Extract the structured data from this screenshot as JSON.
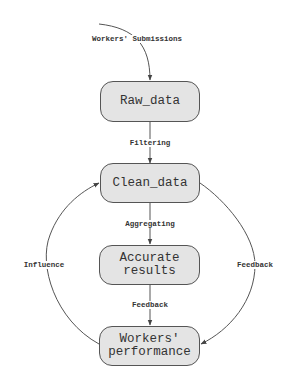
{
  "diagram": {
    "nodes": [
      {
        "id": "raw_data",
        "label": "Raw_data"
      },
      {
        "id": "clean_data",
        "label": "Clean_data"
      },
      {
        "id": "accurate_results",
        "label": "Accurate\nresults"
      },
      {
        "id": "workers_performance",
        "label": "Workers'\nperformance"
      }
    ],
    "edges": [
      {
        "from": "external",
        "to": "raw_data",
        "label": "Workers' Submissions"
      },
      {
        "from": "raw_data",
        "to": "clean_data",
        "label": "Filtering"
      },
      {
        "from": "clean_data",
        "to": "accurate_results",
        "label": "Aggregating"
      },
      {
        "from": "accurate_results",
        "to": "workers_performance",
        "label": "Feedback"
      },
      {
        "from": "workers_performance",
        "to": "clean_data",
        "label": "Influence"
      },
      {
        "from": "clean_data",
        "to": "workers_performance",
        "label": "Feedback"
      }
    ],
    "colors": {
      "node_fill": "#e4e4e4",
      "node_border": "#555555",
      "edge": "#555555",
      "text": "#333333"
    }
  }
}
